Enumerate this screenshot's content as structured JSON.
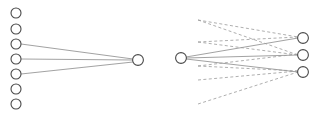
{
  "figure": {
    "canvas": {
      "width": 322,
      "height": 124,
      "background": "#ffffff"
    },
    "title": "",
    "colors": {
      "node_stroke": "#4a4a4a",
      "node_fill": "#ffffff",
      "solid_edge": "#8a8a8a",
      "dashed_edge": "#9a9a9a"
    },
    "panels": [
      {
        "id": "left-panel",
        "name": "left-graph",
        "node_radius": 5,
        "nodes": [
          {
            "id": "L0",
            "name": "left-source-node-1",
            "cx": 16,
            "cy": 13,
            "r": 5,
            "label": ""
          },
          {
            "id": "L1",
            "name": "left-source-node-2",
            "cx": 16,
            "cy": 29,
            "r": 5,
            "label": ""
          },
          {
            "id": "L2",
            "name": "left-source-node-3",
            "cx": 16,
            "cy": 44,
            "r": 5,
            "label": ""
          },
          {
            "id": "L3",
            "name": "left-source-node-4",
            "cx": 16,
            "cy": 59,
            "r": 5,
            "label": ""
          },
          {
            "id": "L4",
            "name": "left-source-node-5",
            "cx": 16,
            "cy": 74,
            "r": 5,
            "label": ""
          },
          {
            "id": "L5",
            "name": "left-source-node-6",
            "cx": 16,
            "cy": 89,
            "r": 5,
            "label": ""
          },
          {
            "id": "L6",
            "name": "left-source-node-7",
            "cx": 16,
            "cy": 104,
            "r": 5,
            "label": ""
          },
          {
            "id": "LH",
            "name": "left-hub-node",
            "cx": 138,
            "cy": 60,
            "r": 5.4,
            "label": ""
          }
        ],
        "edges": [
          {
            "id": "LE0",
            "name": "left-solid-edge-1",
            "style": "solid",
            "x1": 21,
            "y1": 44,
            "x2": 133,
            "y2": 59
          },
          {
            "id": "LE1",
            "name": "left-solid-edge-2",
            "style": "solid",
            "x1": 21,
            "y1": 59,
            "x2": 133,
            "y2": 60
          },
          {
            "id": "LE2",
            "name": "left-solid-edge-3",
            "style": "solid",
            "x1": 21,
            "y1": 74,
            "x2": 133,
            "y2": 62
          }
        ]
      },
      {
        "id": "right-panel",
        "name": "right-graph",
        "node_radius": 5,
        "nodes": [
          {
            "id": "RS",
            "name": "right-source-node",
            "cx": 181,
            "cy": 58,
            "r": 5.4,
            "label": ""
          },
          {
            "id": "R0",
            "name": "right-target-node-1",
            "cx": 303,
            "cy": 38,
            "r": 5.4,
            "label": ""
          },
          {
            "id": "R1",
            "name": "right-target-node-2",
            "cx": 303,
            "cy": 55,
            "r": 5.4,
            "label": ""
          },
          {
            "id": "R2",
            "name": "right-target-node-3",
            "cx": 303,
            "cy": 72,
            "r": 5.4,
            "label": ""
          }
        ],
        "edges": [
          {
            "id": "RE0",
            "name": "right-solid-edge-1",
            "style": "solid",
            "x1": 186,
            "y1": 57,
            "x2": 298,
            "y2": 38
          },
          {
            "id": "RE1",
            "name": "right-solid-edge-2",
            "style": "solid",
            "x1": 186,
            "y1": 58,
            "x2": 298,
            "y2": 55
          },
          {
            "id": "RE2",
            "name": "right-solid-edge-3",
            "style": "solid",
            "x1": 186,
            "y1": 59,
            "x2": 298,
            "y2": 72
          },
          {
            "id": "RD0",
            "name": "right-dashed-edge-1",
            "style": "dashed",
            "x1": 198,
            "y1": 20,
            "x2": 298,
            "y2": 37
          },
          {
            "id": "RD1",
            "name": "right-dashed-edge-2",
            "style": "dashed",
            "x1": 198,
            "y1": 42,
            "x2": 298,
            "y2": 37
          },
          {
            "id": "RD2",
            "name": "right-dashed-edge-3",
            "style": "dashed",
            "x1": 198,
            "y1": 20,
            "x2": 298,
            "y2": 55
          },
          {
            "id": "RD3",
            "name": "right-dashed-edge-4",
            "style": "dashed",
            "x1": 198,
            "y1": 42,
            "x2": 298,
            "y2": 55
          },
          {
            "id": "RD4",
            "name": "right-dashed-edge-5",
            "style": "dashed",
            "x1": 198,
            "y1": 66,
            "x2": 298,
            "y2": 54
          },
          {
            "id": "RD5",
            "name": "right-dashed-edge-6",
            "style": "dashed",
            "x1": 198,
            "y1": 66,
            "x2": 298,
            "y2": 71
          },
          {
            "id": "RD6",
            "name": "right-dashed-edge-7",
            "style": "dashed",
            "x1": 198,
            "y1": 80,
            "x2": 298,
            "y2": 71
          },
          {
            "id": "RD7",
            "name": "right-dashed-edge-8",
            "style": "dashed",
            "x1": 198,
            "y1": 104,
            "x2": 298,
            "y2": 72
          }
        ]
      }
    ]
  }
}
